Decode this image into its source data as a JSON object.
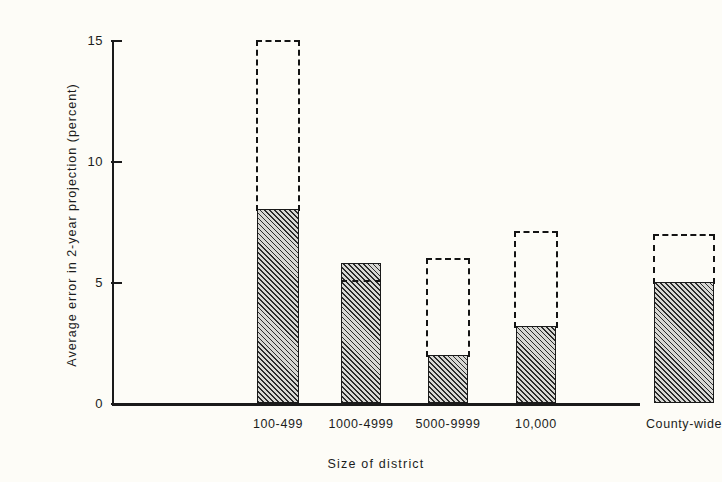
{
  "chart_data": {
    "type": "bar",
    "title": "",
    "xlabel": "Size of district",
    "ylabel": "Average error in 2-year projection (percent)",
    "categories": [
      "100-499",
      "1000-4999",
      "5000-9999",
      "10,000",
      "County-wide"
    ],
    "ylim": [
      0,
      15
    ],
    "yticks": [
      0,
      5,
      10,
      15
    ],
    "ytick_labels": [
      "0",
      "5",
      "10",
      "15"
    ],
    "grid": false,
    "legend": null,
    "series": [
      {
        "name": "Average error (hatched bar)",
        "style": "hatched-solid-outline",
        "values": [
          8.0,
          5.8,
          2.0,
          3.2,
          5.0
        ]
      },
      {
        "name": "Upper range (dashed outline)",
        "style": "dashed-outline",
        "values": [
          15.0,
          5.1,
          6.0,
          7.1,
          7.0
        ]
      }
    ],
    "bars": [
      {
        "category": "100-499",
        "solid": 8.0,
        "dashed": 15.0,
        "dashed_above": true,
        "x_center": 166,
        "width": 42,
        "dashed_width": 44
      },
      {
        "category": "1000-4999",
        "solid": 5.8,
        "dashed": 5.1,
        "dashed_above": false,
        "x_center": 249,
        "width": 40,
        "dashed_width": 40
      },
      {
        "category": "5000-9999",
        "solid": 2.0,
        "dashed": 6.0,
        "dashed_above": true,
        "x_center": 336,
        "width": 40,
        "dashed_width": 44
      },
      {
        "category": "10,000",
        "solid": 3.2,
        "dashed": 7.1,
        "dashed_above": true,
        "x_center": 424,
        "width": 40,
        "dashed_width": 44
      },
      {
        "category": "County-wide",
        "solid": 5.0,
        "dashed": 7.0,
        "dashed_above": true,
        "x_center": 572,
        "width": 60,
        "dashed_width": 62
      }
    ]
  }
}
